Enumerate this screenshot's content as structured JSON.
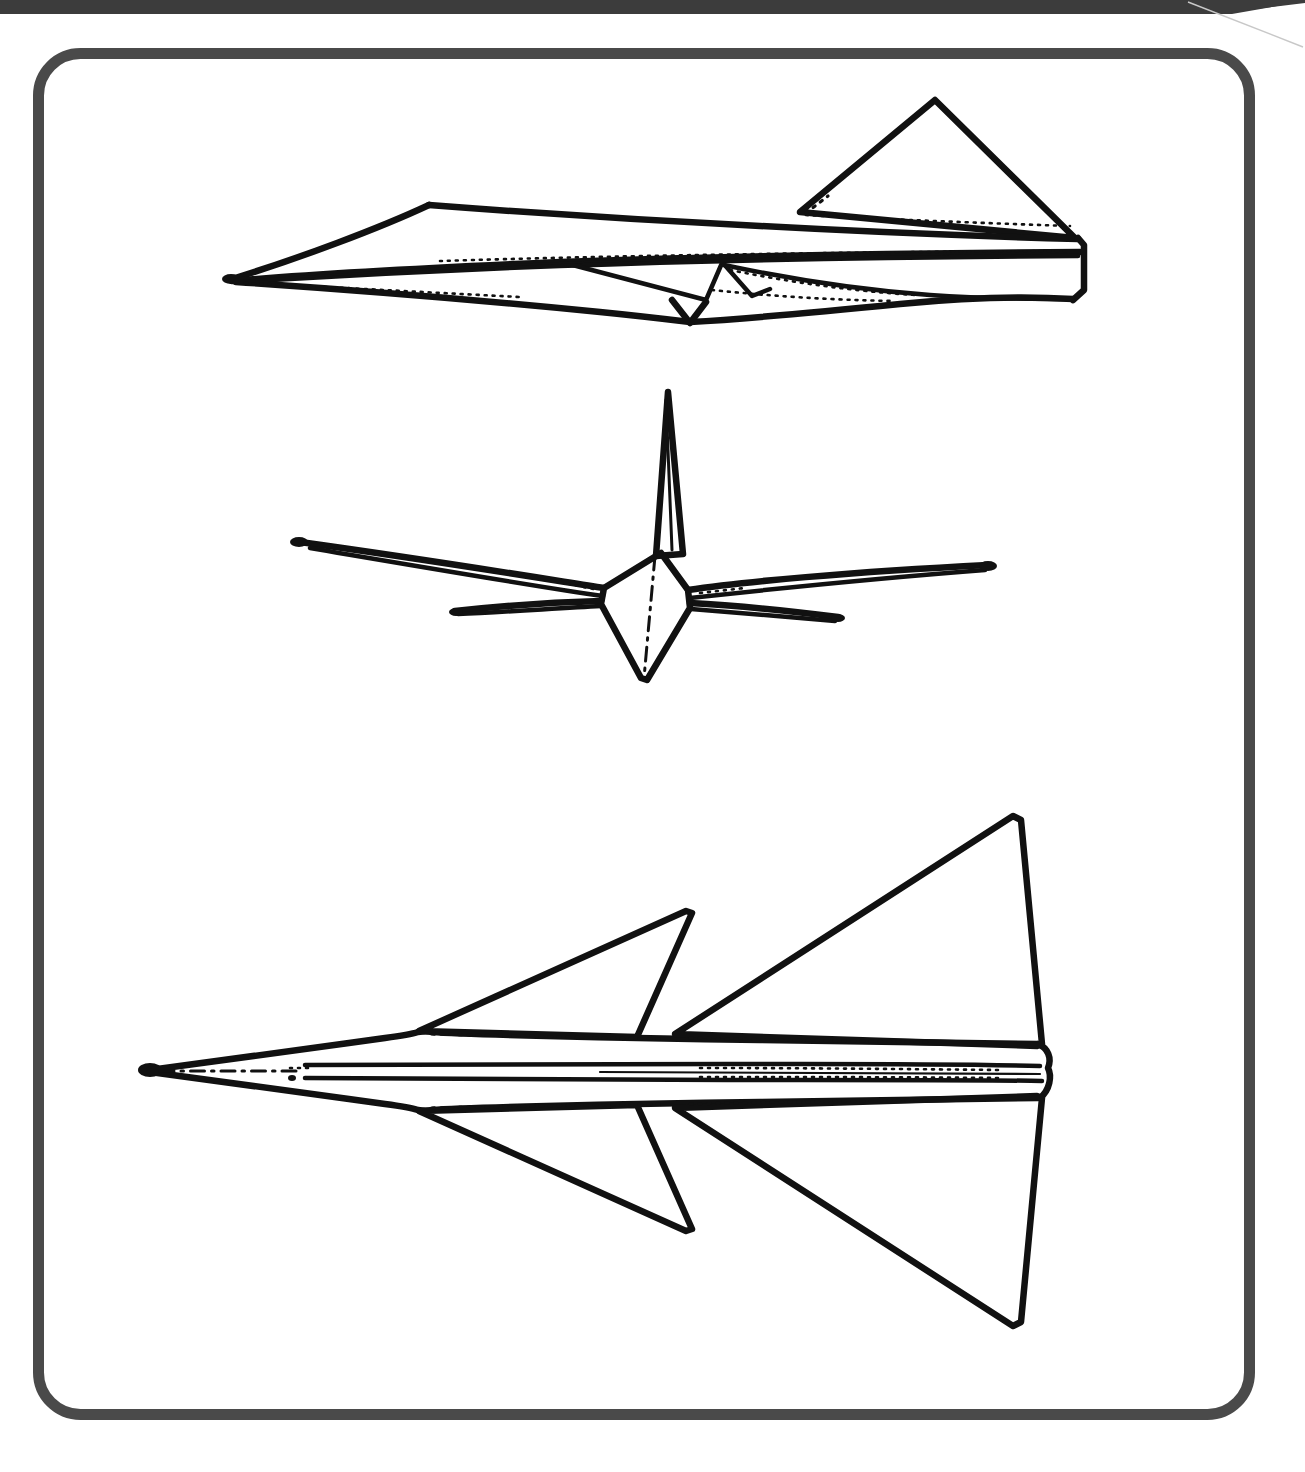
{
  "document": {
    "kind": "technical-line-drawing",
    "subject": "Supersonic delta-wing transport aircraft — three-view general arrangement",
    "background_color": "#ffffff",
    "ink_color": "#111111",
    "frame_color": "#4a4a4a",
    "topbar_color": "#3c3c3c"
  },
  "page_frame": {
    "name": "rounded-border-frame",
    "x": 33,
    "y": 48,
    "width": 1222,
    "height": 1372,
    "corner_radius": 42,
    "stroke_width": 11,
    "color": "#4a4a4a"
  },
  "top_banner": {
    "name": "top-banner-bar",
    "x": 0,
    "y": 0,
    "width": 1305,
    "height": 14,
    "color": "#3c3c3c",
    "notch": {
      "description": "diagonal cut at right end",
      "start_x": 1186,
      "end_x": 1305,
      "end_y": 0
    },
    "hairline_diagonal": {
      "x1": 1186,
      "y1": 0,
      "x2": 1305,
      "y2": 46,
      "color": "#c8c8c8"
    }
  },
  "views": [
    {
      "id": "side-view",
      "name": "aircraft-side-elevation",
      "label": "Side elevation",
      "bounds": {
        "x": 222,
        "y": 95,
        "width": 862,
        "height": 235
      },
      "features": [
        "pointed nose / drooped radome",
        "cockpit peak",
        "long slender fuselage",
        "triangular vertical fin",
        "underslung engine nacelles",
        "delta wing trailing edge",
        "aft fuselage / tail cone"
      ]
    },
    {
      "id": "front-view",
      "name": "aircraft-front-elevation",
      "label": "Front elevation",
      "bounds": {
        "x": 290,
        "y": 390,
        "width": 700,
        "height": 290
      },
      "features": [
        "kite-shaped fuselage cross-section",
        "tall vertical fin",
        "left and right wings with slight anhedral",
        "forward canards below wing plane",
        "vertical centerline (dash-dot)"
      ]
    },
    {
      "id": "plan-view",
      "name": "aircraft-plan-view",
      "label": "Plan view",
      "bounds": {
        "x": 140,
        "y": 815,
        "width": 890,
        "height": 530
      },
      "features": [
        "sharp nose spike",
        "long fuselage with parallel side lines",
        "forward swept-back canards (port and starboard)",
        "large swept delta main wings",
        "near-vertical wing trailing edges",
        "blunt aft fuselage end",
        "longitudinal centerline (dash-dot)"
      ]
    }
  ],
  "line_styles": {
    "solid_heavy": "visible outline",
    "solid_fine": "surface / panel break line",
    "dashed_fine": "hidden edge",
    "dash_dot": "centerline / axis of symmetry"
  }
}
